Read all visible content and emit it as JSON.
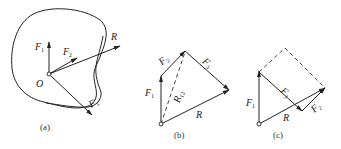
{
  "figures": [
    {
      "caption": "(a)",
      "origin_label": "O",
      "vectors": [
        {
          "label": "F",
          "sub": "1"
        },
        {
          "label": "F",
          "sub": "2"
        },
        {
          "label": "R",
          "sub": ""
        },
        {
          "label": "F",
          "sub": "3"
        }
      ]
    },
    {
      "caption": "(b)",
      "vectors": [
        {
          "label": "F",
          "sub": "1"
        },
        {
          "label": "F",
          "sub": "2"
        },
        {
          "label": "F",
          "sub": "3"
        },
        {
          "label": "R",
          "sub": "12"
        },
        {
          "label": "R",
          "sub": ""
        }
      ]
    },
    {
      "caption": "(c)",
      "vectors": [
        {
          "label": "F",
          "sub": "1"
        },
        {
          "label": "F",
          "sub": "3"
        },
        {
          "label": "F",
          "sub": "2"
        },
        {
          "label": "R",
          "sub": ""
        }
      ]
    }
  ],
  "colors": {
    "stroke": "#222222",
    "background": "#ffffff"
  }
}
